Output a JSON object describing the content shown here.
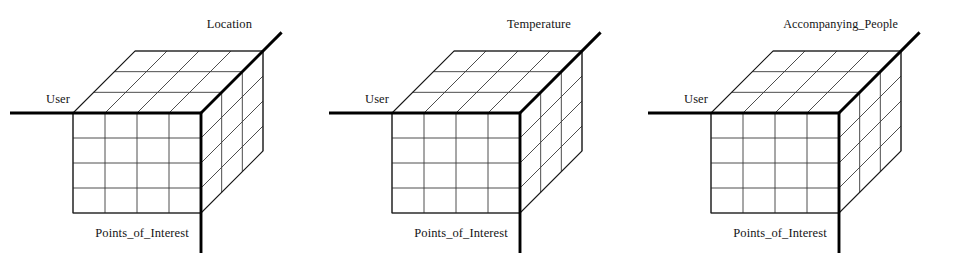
{
  "figure": {
    "type": "data-cube-diagram",
    "background_color": "#ffffff",
    "line_color": "#1a1a1a",
    "grid_color": "#3a3a3a",
    "axis_color": "#000000",
    "cube_count": 3
  },
  "common": {
    "x_axis_label": "User",
    "y_axis_label": "Points_of_Interest",
    "front_face_columns": 4,
    "front_face_rows": 4,
    "depth_divisions": 3
  },
  "cubes": [
    {
      "id": "cube-location",
      "z_axis_label": "Location",
      "x_axis_label": "User",
      "y_axis_label": "Points_of_Interest"
    },
    {
      "id": "cube-temperature",
      "z_axis_label": "Temperature",
      "x_axis_label": "User",
      "y_axis_label": "Points_of_Interest"
    },
    {
      "id": "cube-accompanying-people",
      "z_axis_label": "Accompanying_People",
      "x_axis_label": "User",
      "y_axis_label": "Points_of_Interest"
    }
  ]
}
